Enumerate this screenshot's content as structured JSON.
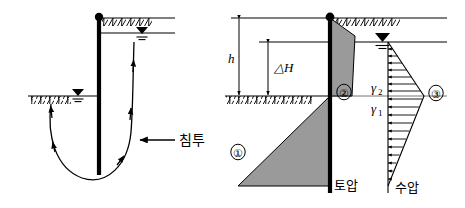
{
  "figure": {
    "title": "",
    "panels": [
      {
        "id": "left-panel",
        "name": "seepage-around-sheet-pile",
        "labels": {
          "seepage": "침투"
        },
        "icons": {
          "water-table": "water-table-symbol",
          "ground-hatch": "ground-hatch-pattern",
          "wall-top-node": "wall-top-dot",
          "flow-arrow": "flow-direction-arrow"
        }
      },
      {
        "id": "right-panel",
        "name": "pressure-distribution-diagram",
        "labels": {
          "h": "h",
          "delta_h": "△H",
          "gamma_top": "γ",
          "gamma_top_sub": "2",
          "gamma_bottom": "γ",
          "gamma_bottom_sub": "1",
          "earth_pressure": "토압",
          "water_pressure": "수압",
          "marker_1": "①",
          "marker_2": "②",
          "marker_3": "③"
        },
        "icons": {
          "water-table": "water-table-symbol",
          "ground-hatch": "ground-hatch-pattern",
          "wall-top-node": "wall-top-dot",
          "pressure-arrow": "pressure-direction-arrow",
          "dimension-arrow": "dimension-double-arrow"
        }
      }
    ],
    "colors": {
      "line": "#000000",
      "thin_line": "#555555",
      "fill_gray": "#9a9a9a",
      "background": "#ffffff"
    }
  }
}
